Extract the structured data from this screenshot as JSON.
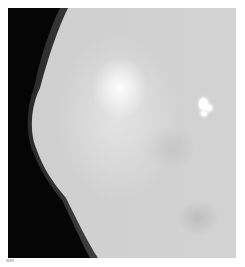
{
  "image": {
    "type": "mammogram",
    "description": "Grayscale breast X-ray with dense central tissue and a bright focal calcification cluster in upper right",
    "colors": {
      "background": "#050505",
      "tissue": "#d0d0d0",
      "dense_core": "#ffffff",
      "calcification": "#ffffff"
    },
    "findings": [
      {
        "label": "calcification",
        "x": 205,
        "y": 105
      }
    ]
  }
}
